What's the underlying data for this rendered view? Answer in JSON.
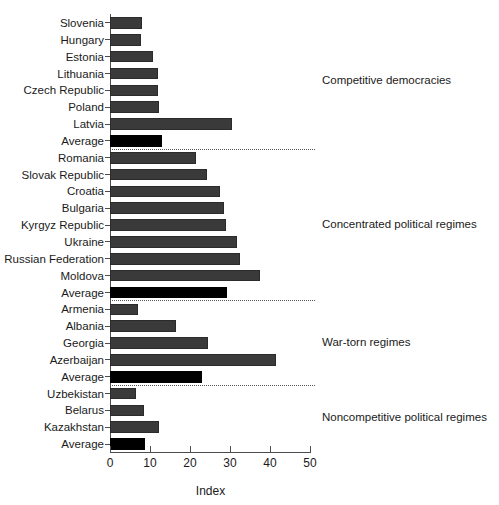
{
  "chart_data": {
    "type": "bar",
    "orientation": "horizontal",
    "title": "",
    "xlabel": "Index",
    "ylabel": "",
    "xlim": [
      0,
      50
    ],
    "xticks": [
      0,
      10,
      20,
      30,
      40,
      50
    ],
    "grid": false,
    "legend": null,
    "series_colors": {
      "country_bar": "#3a3a3a",
      "average_bar": "#000000"
    },
    "categories": [
      "Slovenia",
      "Hungary",
      "Estonia",
      "Lithuania",
      "Czech Republic",
      "Poland",
      "Latvia",
      "Average",
      "Romania",
      "Slovak Republic",
      "Croatia",
      "Bulgaria",
      "Kyrgyz Republic",
      "Ukraine",
      "Russian Federation",
      "Moldova",
      "Average",
      "Armenia",
      "Albania",
      "Georgia",
      "Azerbaijan",
      "Average",
      "Uzbekistan",
      "Belarus",
      "Kazakhstan",
      "Average"
    ],
    "values": [
      7.9,
      7.8,
      10.7,
      11.9,
      11.9,
      12.3,
      30.4,
      13.1,
      21.4,
      24.2,
      27.5,
      28.6,
      28.9,
      31.7,
      32.5,
      37.5,
      29.2,
      7.1,
      16.4,
      24.4,
      41.4,
      23.1,
      6.5,
      8.6,
      12.3,
      8.8
    ],
    "bars": [
      {
        "label": "Slovenia",
        "value": 7.9,
        "is_average": false,
        "group": "Competitive democracies"
      },
      {
        "label": "Hungary",
        "value": 7.8,
        "is_average": false,
        "group": "Competitive democracies"
      },
      {
        "label": "Estonia",
        "value": 10.7,
        "is_average": false,
        "group": "Competitive democracies"
      },
      {
        "label": "Lithuania",
        "value": 11.9,
        "is_average": false,
        "group": "Competitive democracies"
      },
      {
        "label": "Czech Republic",
        "value": 11.9,
        "is_average": false,
        "group": "Competitive democracies"
      },
      {
        "label": "Poland",
        "value": 12.3,
        "is_average": false,
        "group": "Competitive democracies"
      },
      {
        "label": "Latvia",
        "value": 30.4,
        "is_average": false,
        "group": "Competitive democracies"
      },
      {
        "label": "Average",
        "value": 13.1,
        "is_average": true,
        "group": "Competitive democracies"
      },
      {
        "label": "Romania",
        "value": 21.4,
        "is_average": false,
        "group": "Concentrated political regimes"
      },
      {
        "label": "Slovak Republic",
        "value": 24.2,
        "is_average": false,
        "group": "Concentrated political regimes"
      },
      {
        "label": "Croatia",
        "value": 27.5,
        "is_average": false,
        "group": "Concentrated political regimes"
      },
      {
        "label": "Bulgaria",
        "value": 28.6,
        "is_average": false,
        "group": "Concentrated political regimes"
      },
      {
        "label": "Kyrgyz Republic",
        "value": 28.9,
        "is_average": false,
        "group": "Concentrated political regimes"
      },
      {
        "label": "Ukraine",
        "value": 31.7,
        "is_average": false,
        "group": "Concentrated political regimes"
      },
      {
        "label": "Russian Federation",
        "value": 32.5,
        "is_average": false,
        "group": "Concentrated political regimes"
      },
      {
        "label": "Moldova",
        "value": 37.5,
        "is_average": false,
        "group": "Concentrated political regimes"
      },
      {
        "label": "Average",
        "value": 29.2,
        "is_average": true,
        "group": "Concentrated political regimes"
      },
      {
        "label": "Armenia",
        "value": 7.1,
        "is_average": false,
        "group": "War-torn regimes"
      },
      {
        "label": "Albania",
        "value": 16.4,
        "is_average": false,
        "group": "War-torn regimes"
      },
      {
        "label": "Georgia",
        "value": 24.4,
        "is_average": false,
        "group": "War-torn regimes"
      },
      {
        "label": "Azerbaijan",
        "value": 41.4,
        "is_average": false,
        "group": "War-torn regimes"
      },
      {
        "label": "Average",
        "value": 23.1,
        "is_average": true,
        "group": "War-torn regimes"
      },
      {
        "label": "Uzbekistan",
        "value": 6.5,
        "is_average": false,
        "group": "Noncompetitive political regimes"
      },
      {
        "label": "Belarus",
        "value": 8.6,
        "is_average": false,
        "group": "Noncompetitive political regimes"
      },
      {
        "label": "Kazakhstan",
        "value": 12.3,
        "is_average": false,
        "group": "Noncompetitive political regimes"
      },
      {
        "label": "Average",
        "value": 8.8,
        "is_average": true,
        "group": "Noncompetitive political regimes"
      }
    ],
    "group_annotations": [
      {
        "label": "Competitive democracies",
        "start_index": 0,
        "end_index": 7
      },
      {
        "label": "Concentrated political regimes",
        "start_index": 8,
        "end_index": 16
      },
      {
        "label": "War-torn regimes",
        "start_index": 17,
        "end_index": 21
      },
      {
        "label": "Noncompetitive political regimes",
        "start_index": 22,
        "end_index": 25
      }
    ],
    "group_separators_after_index": [
      7,
      16,
      21
    ]
  }
}
